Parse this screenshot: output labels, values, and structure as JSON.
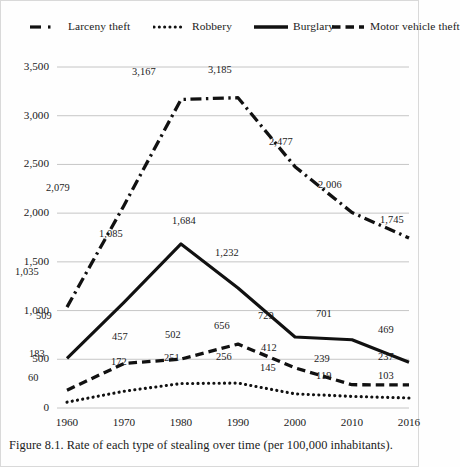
{
  "figure": {
    "caption": "Figure 8.1. Rate of each type of stealing over time (per 100,000 inhabitants)."
  },
  "legend": [
    {
      "key": "larceny",
      "label": "Larceny theft",
      "style": "dash-dot",
      "x": 28
    },
    {
      "key": "robbery",
      "label": "Robbery",
      "style": "dotted",
      "x": 152
    },
    {
      "key": "burglary",
      "label": "Burglary",
      "style": "solid",
      "x": 253
    },
    {
      "key": "mvt",
      "label": "Motor vehicle theft",
      "style": "dashed",
      "x": 330
    }
  ],
  "chart_data": {
    "type": "line",
    "title": "",
    "xlabel": "",
    "ylabel": "",
    "categories": [
      "1960",
      "1970",
      "1980",
      "1990",
      "2000",
      "2010",
      "2016"
    ],
    "x_tick_labels": [
      "1960",
      "1970",
      "1980",
      "1990",
      "2000",
      "2010",
      "2016"
    ],
    "y_tick_labels": [
      "0",
      "500",
      "1,000",
      "1,500",
      "2,000",
      "2,500",
      "3,000",
      "3,500"
    ],
    "y_ticks": [
      0,
      500,
      1000,
      1500,
      2000,
      2500,
      3000,
      3500
    ],
    "ylim": [
      0,
      3500
    ],
    "grid": true,
    "legend_position": "top",
    "series": [
      {
        "name": "Larceny theft",
        "style": "dash-dot",
        "color": "#111111",
        "values": [
          1035,
          2079,
          3167,
          3185,
          2477,
          2006,
          1745
        ],
        "labels": [
          "1,035",
          "2,079",
          "3,167",
          "3,185",
          "2,477",
          "2,006",
          "1,745"
        ]
      },
      {
        "name": "Robbery",
        "style": "dotted",
        "color": "#111111",
        "values": [
          60,
          172,
          251,
          256,
          145,
          119,
          103
        ],
        "labels": [
          "60",
          "172",
          "251",
          "256",
          "145",
          "119",
          "103"
        ]
      },
      {
        "name": "Burglary",
        "style": "solid",
        "color": "#111111",
        "values": [
          509,
          1085,
          1684,
          1232,
          729,
          701,
          469
        ],
        "labels": [
          "509",
          "1,085",
          "1,684",
          "1,232",
          "729",
          "701",
          "469"
        ]
      },
      {
        "name": "Motor vehicle theft",
        "style": "dashed",
        "color": "#111111",
        "values": [
          183,
          457,
          502,
          656,
          412,
          239,
          237
        ],
        "labels": [
          "183",
          "457",
          "502",
          "656",
          "412",
          "239",
          "237"
        ]
      }
    ]
  },
  "point_labels": [
    {
      "text": "1,035",
      "x": 14,
      "y": 218
    },
    {
      "text": "2,079",
      "x": 45,
      "y": 134
    },
    {
      "text": "3,167",
      "x": 131,
      "y": 18
    },
    {
      "text": "3,185",
      "x": 207,
      "y": 16
    },
    {
      "text": "2,477",
      "x": 268,
      "y": 88
    },
    {
      "text": "2,006",
      "x": 317,
      "y": 131
    },
    {
      "text": "1,745",
      "x": 379,
      "y": 166
    },
    {
      "text": "509",
      "x": 35,
      "y": 262
    },
    {
      "text": "1,085",
      "x": 98,
      "y": 180
    },
    {
      "text": "1,684",
      "x": 171,
      "y": 167
    },
    {
      "text": "1,232",
      "x": 214,
      "y": 199
    },
    {
      "text": "729",
      "x": 257,
      "y": 262
    },
    {
      "text": "701",
      "x": 315,
      "y": 260
    },
    {
      "text": "469",
      "x": 377,
      "y": 276
    },
    {
      "text": "183",
      "x": 28,
      "y": 300
    },
    {
      "text": "457",
      "x": 111,
      "y": 283
    },
    {
      "text": "502",
      "x": 164,
      "y": 281
    },
    {
      "text": "656",
      "x": 213,
      "y": 272
    },
    {
      "text": "412",
      "x": 260,
      "y": 294
    },
    {
      "text": "239",
      "x": 313,
      "y": 305
    },
    {
      "text": "237",
      "x": 377,
      "y": 303
    },
    {
      "text": "60",
      "x": 27,
      "y": 324
    },
    {
      "text": "172",
      "x": 110,
      "y": 308
    },
    {
      "text": "251",
      "x": 163,
      "y": 304
    },
    {
      "text": "256",
      "x": 215,
      "y": 303
    },
    {
      "text": "145",
      "x": 259,
      "y": 314
    },
    {
      "text": "119",
      "x": 315,
      "y": 322
    },
    {
      "text": "103",
      "x": 377,
      "y": 322
    }
  ]
}
